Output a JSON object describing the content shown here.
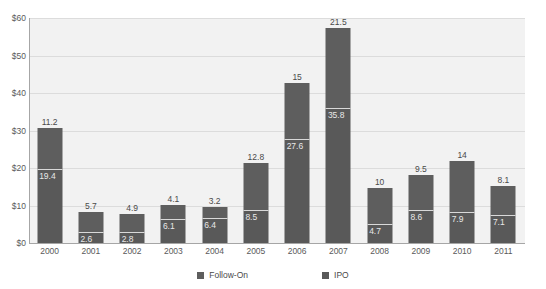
{
  "chart_data": {
    "type": "bar",
    "subtype": "stacked-column",
    "title": "",
    "xlabel": "",
    "ylabel": "",
    "categories": [
      "2000",
      "2001",
      "2002",
      "2003",
      "2004",
      "2005",
      "2006",
      "2007",
      "2008",
      "2009",
      "2010",
      "2011"
    ],
    "series": [
      {
        "name": "IPO",
        "color": "#595959",
        "values": [
          19.4,
          2.6,
          2.8,
          6.1,
          6.4,
          8.5,
          27.6,
          35.8,
          4.7,
          8.6,
          7.9,
          7.1
        ]
      },
      {
        "name": "Follow-On",
        "color": "#5e5e5e",
        "values": [
          11.2,
          5.7,
          4.9,
          4.1,
          3.2,
          12.8,
          15,
          21.5,
          10,
          9.5,
          14,
          8.1
        ]
      }
    ],
    "totals": [
      30.6,
      8.3,
      7.7,
      10.2,
      9.6,
      21.3,
      42.6,
      57.3,
      14.7,
      18.1,
      21.9,
      15.2
    ],
    "ylim": [
      0,
      60
    ],
    "ytick_values": [
      0,
      10,
      20,
      30,
      40,
      50,
      60
    ],
    "ytick_labels": [
      "$0",
      "$10",
      "$20",
      "$30",
      "$40",
      "$50",
      "$60"
    ],
    "grid": true,
    "legend_position": "bottom",
    "legend_entries": [
      "Follow-On",
      "IPO"
    ],
    "plot_background": "#f2f2f2",
    "gridline_color": "#dcdcdc",
    "axis_color": "#a6a6a6"
  }
}
